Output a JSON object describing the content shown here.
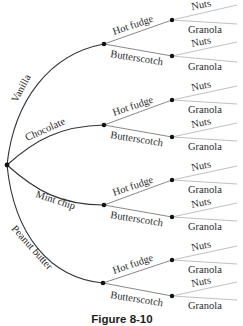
{
  "diagram": {
    "type": "tree",
    "root": {
      "x": 7,
      "y": 165
    },
    "level1": [
      {
        "label": "Vanilla",
        "node": {
          "x": 104,
          "y": 44
        }
      },
      {
        "label": "Chocolate",
        "node": {
          "x": 104,
          "y": 125
        }
      },
      {
        "label": "Mint chip",
        "node": {
          "x": 104,
          "y": 205
        }
      },
      {
        "label": "Peanut butter",
        "node": {
          "x": 103,
          "y": 283
        }
      }
    ],
    "level2_labels": [
      "Hot fudge",
      "Butterscotch"
    ],
    "level3_labels": [
      "Nuts",
      "Granola"
    ],
    "labels": {
      "vanilla": "Vanilla",
      "chocolate": "Chocolate",
      "mint_chip": "Mint chip",
      "peanut_butter": "Peanut butter",
      "v_hot_fudge": "Hot fudge",
      "v_butterscotch": "Butterscotch",
      "c_hot_fudge": "Hot fudge",
      "c_butterscotch": "Butterscotch",
      "m_hot_fudge": "Hot fudge",
      "m_butterscotch": "Butterscotch",
      "p_hot_fudge": "Hot fudge",
      "p_butterscotch": "Butterscotch",
      "nuts": "Nuts",
      "granola": "Granola"
    },
    "caption": "Figure 8-10"
  }
}
